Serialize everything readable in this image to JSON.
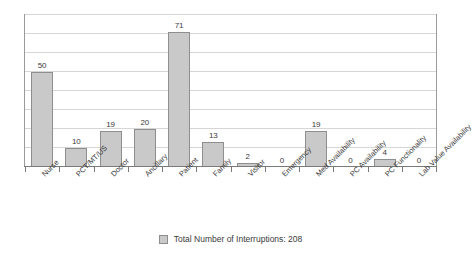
{
  "chart_data": {
    "type": "bar",
    "title": "",
    "xlabel": "",
    "ylabel": "",
    "ylim": [
      0,
      80
    ],
    "grid": true,
    "legend_position": "bottom",
    "legend_entries": [
      "Total Number of Interruptions: 208"
    ],
    "categories": [
      "Nurse",
      "PCT/MT/US",
      "Doctor",
      "Ancillary",
      "Patient",
      "Family",
      "Visitor",
      "Emergency",
      "Med Availability",
      "PC Availability",
      "PC Functionality",
      "Lab Value Availability"
    ],
    "values": [
      50,
      10,
      19,
      20,
      71,
      13,
      2,
      0,
      19,
      0,
      4,
      0
    ],
    "value_labels": [
      "50",
      "10",
      "19",
      "20",
      "71",
      "13",
      "2",
      "0",
      "19",
      "0",
      "4",
      "0"
    ],
    "series_name": "Total Number of Interruptions",
    "total": 208,
    "colors": {
      "bar_fill": "#c9c9c9",
      "bar_border": "#8e8e8e",
      "gridline": "#d6d6d6",
      "frame": "#9a9a9a",
      "axis": "#7a7a7a",
      "text": "#3a3a3a",
      "background": "#ffffff"
    }
  },
  "legend": {
    "label": "Total Number of Interruptions: 208"
  }
}
